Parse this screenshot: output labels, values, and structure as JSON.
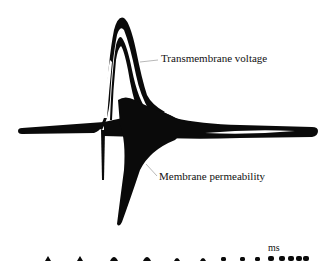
{
  "figure": {
    "type": "oscilloscope trace of an action potential",
    "labels": {
      "voltage": "Transmembrane voltage",
      "permeability": "Membrane permeability",
      "time_unit": "ms"
    },
    "colors": {
      "trace": "#0a0a0a",
      "background": "#ffffff",
      "text": "#111111"
    },
    "time_markers": {
      "count": 14,
      "x_positions": [
        48,
        80,
        114,
        147,
        177,
        203,
        224,
        243,
        258,
        271,
        282,
        291,
        299,
        306
      ]
    }
  }
}
